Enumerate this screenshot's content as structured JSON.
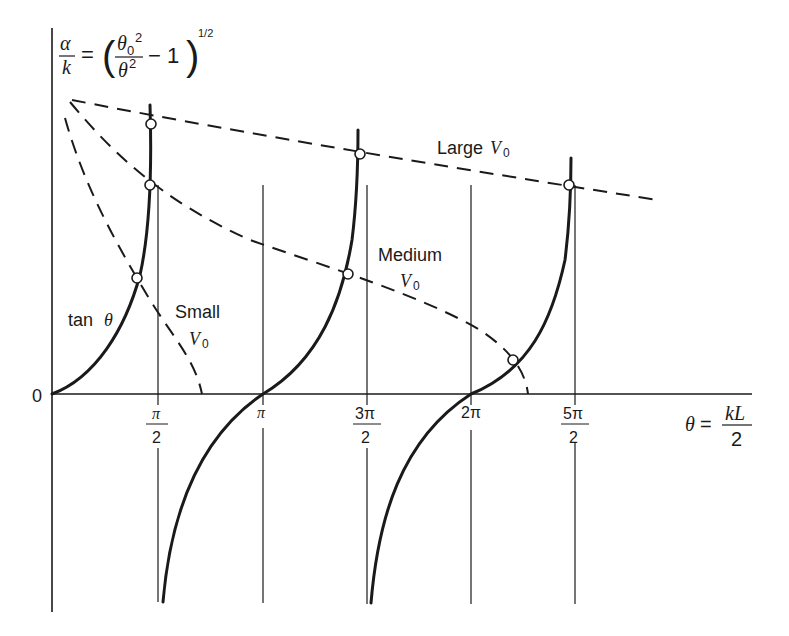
{
  "diagram": {
    "title_formula": {
      "lhs_num": "α",
      "lhs_den": "k",
      "equals": "=",
      "inner_num": "θ",
      "inner_num_sub": "0",
      "inner_num_sup": "2",
      "inner_den": "θ",
      "inner_den_sup": "2",
      "minus_one": "− 1",
      "exponent": "1/2"
    },
    "x_axis": {
      "origin_label": "0",
      "ticks": [
        {
          "num": "π",
          "den": "2"
        },
        {
          "num": "π",
          "den": ""
        },
        {
          "num": "3π",
          "den": "2"
        },
        {
          "num": "2π",
          "den": ""
        },
        {
          "num": "5π",
          "den": "2"
        }
      ],
      "label_lhs": "θ",
      "label_eq": "=",
      "label_num": "kL",
      "label_den": "2"
    },
    "curves": {
      "tan_label": "tan",
      "tan_theta": "θ",
      "small_label": "Small",
      "medium_label": "Medium",
      "large_label": "Large",
      "v_label": "V",
      "v_sub": "0"
    },
    "colors": {
      "ink": "#1a1a1a",
      "background": "#ffffff"
    }
  }
}
